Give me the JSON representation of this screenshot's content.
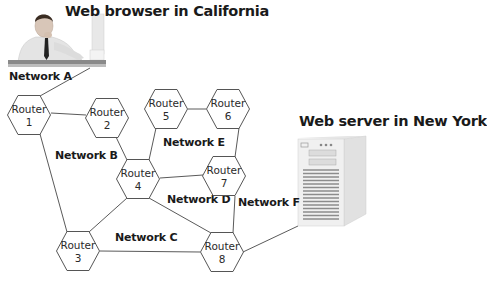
{
  "titles": {
    "browser": "Web browser in California",
    "server": "Web server in New York"
  },
  "networks": [
    {
      "id": "A",
      "label": "Network A"
    },
    {
      "id": "B",
      "label": "Network B"
    },
    {
      "id": "C",
      "label": "Network C"
    },
    {
      "id": "D",
      "label": "Network D"
    },
    {
      "id": "E",
      "label": "Network E"
    },
    {
      "id": "F",
      "label": "Network F"
    }
  ],
  "routers": [
    {
      "word": "Router",
      "num": "1"
    },
    {
      "word": "Router",
      "num": "2"
    },
    {
      "word": "Router",
      "num": "3"
    },
    {
      "word": "Router",
      "num": "4"
    },
    {
      "word": "Router",
      "num": "5"
    },
    {
      "word": "Router",
      "num": "6"
    },
    {
      "word": "Router",
      "num": "7"
    },
    {
      "word": "Router",
      "num": "8"
    }
  ],
  "links": [
    [
      "browser",
      "1"
    ],
    [
      "1",
      "2"
    ],
    [
      "1",
      "3"
    ],
    [
      "2",
      "4"
    ],
    [
      "4",
      "5"
    ],
    [
      "5",
      "6"
    ],
    [
      "6",
      "7"
    ],
    [
      "4",
      "7"
    ],
    [
      "4",
      "3"
    ],
    [
      "4",
      "8"
    ],
    [
      "3",
      "8"
    ],
    [
      "7",
      "8"
    ],
    [
      "8",
      "server"
    ]
  ],
  "colors": {
    "line": "#555555",
    "text": "#1a1a1a"
  }
}
